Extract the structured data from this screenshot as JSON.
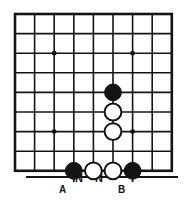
{
  "diagram": {
    "kind": "go-board-diagram",
    "background_color": "#ffffff",
    "ink_color": "#141414"
  },
  "board": {
    "columns": 9,
    "rows": 9,
    "cell_size": 19.6,
    "origin_x": 15,
    "origin_y": 14,
    "line_color": "#141414",
    "line_width": 1.6,
    "border_width": 2.6,
    "star_points": [
      {
        "col": 2,
        "row": 2
      },
      {
        "col": 6,
        "row": 2
      },
      {
        "col": 2,
        "row": 6
      },
      {
        "col": 6,
        "row": 6
      }
    ],
    "star_point_radius": 2.4
  },
  "stones": {
    "black_color": "#141414",
    "white_color": "#ffffff",
    "white_outline_color": "#141414",
    "radius": 8.4,
    "list": [
      {
        "id": "b1",
        "color": "black",
        "col": 5,
        "row": 4
      },
      {
        "id": "w1",
        "color": "white",
        "col": 5,
        "row": 5
      },
      {
        "id": "w2",
        "color": "white",
        "col": 5,
        "row": 6
      },
      {
        "id": "b2",
        "color": "black",
        "col": 3,
        "row": 8,
        "label_ref": "A"
      },
      {
        "id": "w3",
        "color": "white",
        "col": 4,
        "row": 8
      },
      {
        "id": "w4",
        "color": "white",
        "col": 5,
        "row": 8
      },
      {
        "id": "b3",
        "color": "black",
        "col": 6,
        "row": 8,
        "label_ref": "B"
      }
    ]
  },
  "annotations": {
    "arrows": [
      {
        "id": "arrow-a",
        "target_col": 3,
        "points": "up",
        "label": "A",
        "label_x": 62,
        "label_y": 190
      },
      {
        "id": "arrow-b",
        "target_col": 6,
        "points": "up",
        "label": "B",
        "label_x": 121,
        "label_y": 190
      }
    ],
    "marks": [
      {
        "id": "mark-n-1",
        "glyph": "N",
        "col": 4,
        "x": 79,
        "y": 173
      },
      {
        "id": "mark-n-2",
        "glyph": "N",
        "col": 5,
        "x": 99,
        "y": 173
      }
    ],
    "baseline": {
      "x1": 26,
      "x2": 178,
      "y": 177,
      "width": 2.2
    }
  }
}
